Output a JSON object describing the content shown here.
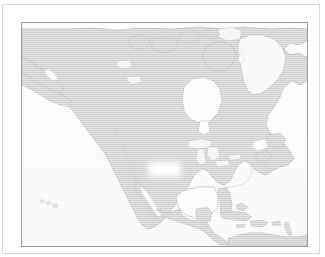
{
  "document": {
    "title": "North America Map",
    "kind": "map-figure"
  },
  "frame": {
    "outer_border_color": "#d9d9d9",
    "background_color": "#ffffff"
  },
  "map": {
    "name": "north-america-map",
    "border_color": "#9a9a9a",
    "ocean_color": "#fafafa",
    "land_color": "#cccccc",
    "coastline_color": "#a8a8a8",
    "lake_color": "#f2f2f2",
    "ice_color": "#f6f6f6",
    "projection_hint": "conic",
    "labels": [],
    "regions": [
      {
        "name": "alaska",
        "fill": "land"
      },
      {
        "name": "canada",
        "fill": "land"
      },
      {
        "name": "greenland",
        "fill": "ice"
      },
      {
        "name": "united-states",
        "fill": "land"
      },
      {
        "name": "mexico",
        "fill": "land"
      },
      {
        "name": "central-america",
        "fill": "land"
      },
      {
        "name": "caribbean-islands",
        "fill": "land"
      },
      {
        "name": "south-america-north",
        "fill": "land"
      },
      {
        "name": "hawaii",
        "fill": "land"
      },
      {
        "name": "great-lakes",
        "fill": "lake"
      },
      {
        "name": "hudson-bay",
        "fill": "ocean"
      },
      {
        "name": "gulf-of-mexico",
        "fill": "ocean"
      },
      {
        "name": "pacific-ocean",
        "fill": "ocean"
      },
      {
        "name": "atlantic-ocean",
        "fill": "ocean"
      }
    ],
    "redaction": {
      "name": "blurred-patch",
      "present": true,
      "color": "#ffffff"
    }
  }
}
